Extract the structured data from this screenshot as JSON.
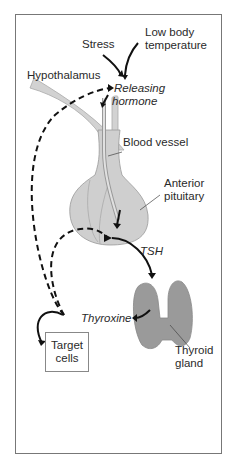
{
  "diagram": {
    "title_cropped": "",
    "labels": {
      "stress": "Stress",
      "low_body_temp_1": "Low body",
      "low_body_temp_2": "temperature",
      "hypothalamus": "Hypothalamus",
      "releasing_1": "Releasing",
      "releasing_2": "hormone",
      "blood_vessel": "Blood vessel",
      "anterior_1": "Anterior",
      "anterior_2": "pituitary",
      "tsh": "TSH",
      "thyroxine": "Thyroxine",
      "target_1": "Target",
      "target_2": "cells",
      "thyroid_1": "Thyroid",
      "thyroid_2": "gland"
    },
    "colors": {
      "border": "#777777",
      "organ_fill": "#c8c8c8",
      "thyroid_fill": "#9a9a9a",
      "arrow": "#111111"
    }
  }
}
